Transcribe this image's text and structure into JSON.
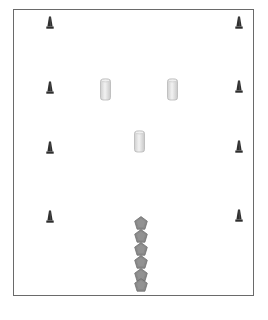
{
  "diagram": {
    "type": "drill-layout",
    "field": {
      "border_color": "#6a6a6a",
      "background": "#ffffff"
    },
    "colors": {
      "cone": "#2e2e2e",
      "bag_fill": "#e2e2e2",
      "bag_edge": "#b8b8b8",
      "marker_fill": "#8a8a8a",
      "marker_edge": "#6e6e6e"
    },
    "cones": [
      {
        "id": "cone-left-1",
        "x": 50,
        "y": 22
      },
      {
        "id": "cone-right-1",
        "x": 239,
        "y": 22
      },
      {
        "id": "cone-left-2",
        "x": 50,
        "y": 87
      },
      {
        "id": "cone-right-2",
        "x": 239,
        "y": 86
      },
      {
        "id": "cone-left-3",
        "x": 50,
        "y": 147
      },
      {
        "id": "cone-right-3",
        "x": 239,
        "y": 146
      },
      {
        "id": "cone-left-4",
        "x": 50,
        "y": 216
      },
      {
        "id": "cone-right-4",
        "x": 239,
        "y": 215
      }
    ],
    "tackle_bags": [
      {
        "id": "bag-left",
        "x": 105,
        "y": 89
      },
      {
        "id": "bag-right",
        "x": 172,
        "y": 89
      },
      {
        "id": "bag-center",
        "x": 139,
        "y": 141
      }
    ],
    "markers": [
      {
        "id": "marker-1",
        "x": 141,
        "y": 223
      },
      {
        "id": "marker-2",
        "x": 141,
        "y": 236
      },
      {
        "id": "marker-3",
        "x": 141,
        "y": 249
      },
      {
        "id": "marker-4",
        "x": 141,
        "y": 262
      },
      {
        "id": "marker-5",
        "x": 141,
        "y": 275
      },
      {
        "id": "marker-6",
        "x": 141,
        "y": 285
      }
    ]
  }
}
